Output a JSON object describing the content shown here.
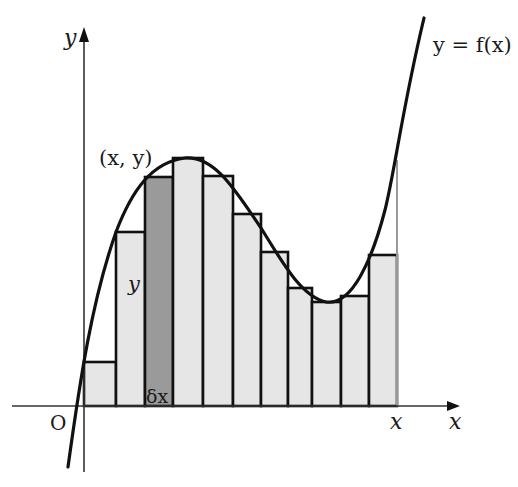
{
  "diagram": {
    "curve_label": "y = f(x)",
    "point_label": "(x, y)",
    "bar_height_label": "y",
    "bar_width_label": "δx",
    "origin_label": "O",
    "x_axis_label": "x",
    "y_axis_label": "y",
    "x_end_label": "x",
    "colors": {
      "bar_fill": "#e6e6e6",
      "highlight_fill": "#9a9a9a",
      "stroke": "#111111",
      "axis": "#333333",
      "guide": "#999999"
    },
    "axes": {
      "origin_px": [
        84,
        406
      ],
      "x_axis_end_px": 455,
      "y_axis_top_px": 28
    },
    "bars": [
      {
        "x0": 84,
        "x1": 116,
        "top": 362,
        "highlight": false
      },
      {
        "x0": 116,
        "x1": 145,
        "top": 232,
        "highlight": false
      },
      {
        "x0": 145,
        "x1": 173,
        "top": 177,
        "highlight": true
      },
      {
        "x0": 173,
        "x1": 203,
        "top": 158,
        "highlight": false
      },
      {
        "x0": 203,
        "x1": 233,
        "top": 176,
        "highlight": false
      },
      {
        "x0": 233,
        "x1": 261,
        "top": 214,
        "highlight": false
      },
      {
        "x0": 261,
        "x1": 288,
        "top": 252,
        "highlight": false
      },
      {
        "x0": 288,
        "x1": 312,
        "top": 288,
        "highlight": false
      },
      {
        "x0": 312,
        "x1": 341,
        "top": 302,
        "highlight": false
      },
      {
        "x0": 341,
        "x1": 369,
        "top": 296,
        "highlight": false
      },
      {
        "x0": 369,
        "x1": 397,
        "top": 255,
        "highlight": false
      }
    ]
  }
}
